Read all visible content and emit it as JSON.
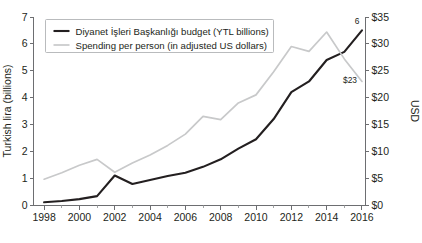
{
  "chart_data": {
    "type": "line",
    "title": "",
    "subtitle": "",
    "xlabel": "",
    "ylabel": "Turkish lira (billions)",
    "y2label": "USD",
    "grid": false,
    "legend_position": "top-left",
    "x": [
      1998,
      1999,
      2000,
      2001,
      2002,
      2003,
      2004,
      2005,
      2006,
      2007,
      2008,
      2009,
      2010,
      2011,
      2012,
      2013,
      2014,
      2015,
      2016
    ],
    "xlim": [
      1997.4,
      2016.2
    ],
    "xticks": [
      1998,
      2000,
      2002,
      2004,
      2006,
      2008,
      2010,
      2012,
      2014,
      2016
    ],
    "xtick_labels": [
      "1998",
      "2000",
      "2002",
      "2004",
      "2006",
      "2008",
      "2010",
      "2012",
      "2014",
      "2016"
    ],
    "xminor_ticks": [
      1998,
      1999,
      2000,
      2001,
      2002,
      2003,
      2004,
      2005,
      2006,
      2007,
      2008,
      2009,
      2010,
      2011,
      2012,
      2013,
      2014,
      2015,
      2016
    ],
    "ylim": [
      0,
      7
    ],
    "yticks": [
      0,
      1,
      2,
      3,
      4,
      5,
      6,
      7
    ],
    "ytick_labels": [
      "0",
      "1",
      "2",
      "3",
      "4",
      "5",
      "6",
      "7"
    ],
    "y2lim": [
      0,
      35
    ],
    "y2ticks": [
      0,
      5,
      10,
      15,
      20,
      25,
      30,
      35
    ],
    "y2tick_labels": [
      "$0",
      "$5",
      "$10",
      "$15",
      "$20",
      "$25",
      "$30",
      "$35"
    ],
    "series": [
      {
        "name": "Diyanet İşleri Başkanlığı budget (YTL billions)",
        "axis": "left",
        "color": "#231f20",
        "values": [
          0.1,
          0.15,
          0.22,
          0.33,
          1.1,
          0.78,
          0.93,
          1.08,
          1.2,
          1.42,
          1.7,
          2.1,
          2.45,
          3.2,
          4.2,
          4.6,
          5.4,
          5.7,
          6.5
        ]
      },
      {
        "name": "Spending per person (in adjusted US dollars)",
        "axis": "right",
        "color": "#c8c9ca",
        "values": [
          4.8,
          6.0,
          7.4,
          8.5,
          6.1,
          7.8,
          9.3,
          11.1,
          13.2,
          16.5,
          15.9,
          19.0,
          20.5,
          24.8,
          29.5,
          28.6,
          32.2,
          27.2,
          23.0
        ]
      }
    ],
    "annotations": [
      {
        "text": "6",
        "series": "Diyanet İşleri Başkanlığı budget (YTL billions)",
        "x": 2016,
        "value": 6.5
      },
      {
        "text": "$23",
        "series": "Spending per person (in adjusted US dollars)",
        "x": 2016,
        "value": 23.0
      }
    ]
  },
  "legend": {
    "items": [
      {
        "label": "Diyanet İşleri Başkanlığı budget (YTL billions)"
      },
      {
        "label": "Spending per person (in adjusted US dollars)"
      }
    ]
  }
}
